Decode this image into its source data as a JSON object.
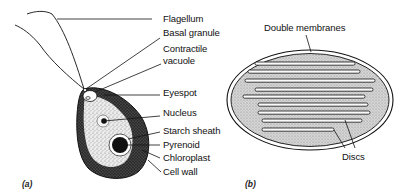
{
  "figure": {
    "panel_a": {
      "tag": "(a)",
      "subject": "euglena-cell",
      "labels": [
        {
          "id": "flagellum",
          "text": "Flagellum"
        },
        {
          "id": "basal-granule",
          "text": "Basal granule"
        },
        {
          "id": "contractile-vacuole-1",
          "text": "Contractile"
        },
        {
          "id": "contractile-vacuole-2",
          "text": "vacuole"
        },
        {
          "id": "eyespot",
          "text": "Eyespot"
        },
        {
          "id": "nucleus",
          "text": "Nucleus"
        },
        {
          "id": "starch-sheath",
          "text": "Starch sheath"
        },
        {
          "id": "pyrenoid",
          "text": "Pyrenoid"
        },
        {
          "id": "chloroplast",
          "text": "Chloroplast"
        },
        {
          "id": "cell-wall",
          "text": "Cell wall"
        }
      ]
    },
    "panel_b": {
      "tag": "(b)",
      "subject": "chloroplast-section",
      "labels": [
        {
          "id": "double-membranes",
          "text": "Double membranes"
        },
        {
          "id": "discs",
          "text": "Discs"
        }
      ]
    },
    "colors": {
      "ink": "#111111",
      "stipple_light": "#d9d9d9",
      "stipple_dark": "#3a3a3a",
      "background": "#ffffff"
    }
  }
}
